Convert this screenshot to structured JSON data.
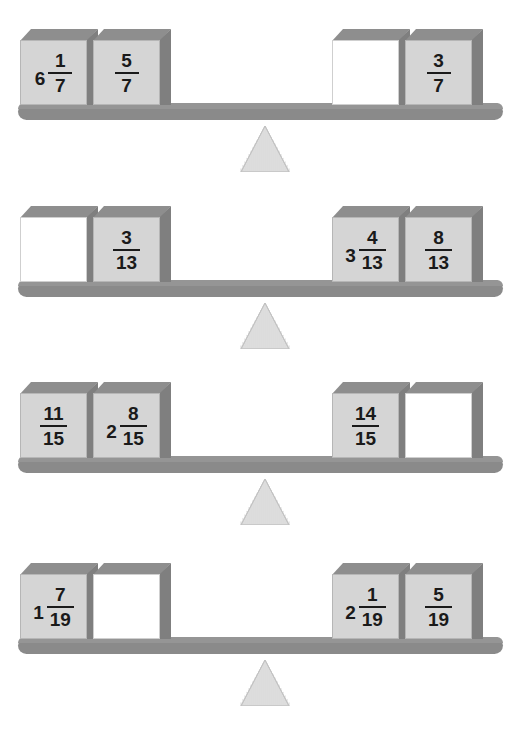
{
  "page": {
    "background_color": "#ffffff",
    "block_color": "#d5d5d5",
    "empty_block_color": "#ffffff",
    "beam_color": "#8a8a8a",
    "fulcrum_color": "#e8e8e8",
    "text_color": "#1a1a1a"
  },
  "balances": [
    {
      "id": "balance-1",
      "denominator": "7",
      "left": [
        {
          "whole": "6",
          "num": "1",
          "den": "7",
          "empty": false
        },
        {
          "whole": "",
          "num": "5",
          "den": "7",
          "empty": false
        }
      ],
      "right": [
        {
          "whole": "",
          "num": "",
          "den": "",
          "empty": true
        },
        {
          "whole": "",
          "num": "3",
          "den": "7",
          "empty": false
        }
      ]
    },
    {
      "id": "balance-2",
      "denominator": "13",
      "left": [
        {
          "whole": "",
          "num": "",
          "den": "",
          "empty": true
        },
        {
          "whole": "",
          "num": "3",
          "den": "13",
          "empty": false
        }
      ],
      "right": [
        {
          "whole": "3",
          "num": "4",
          "den": "13",
          "empty": false
        },
        {
          "whole": "",
          "num": "8",
          "den": "13",
          "empty": false
        }
      ]
    },
    {
      "id": "balance-3",
      "denominator": "15",
      "left": [
        {
          "whole": "",
          "num": "11",
          "den": "15",
          "empty": false
        },
        {
          "whole": "2",
          "num": "8",
          "den": "15",
          "empty": false
        }
      ],
      "right": [
        {
          "whole": "",
          "num": "14",
          "den": "15",
          "empty": false
        },
        {
          "whole": "",
          "num": "",
          "den": "",
          "empty": true
        }
      ]
    },
    {
      "id": "balance-4",
      "denominator": "19",
      "left": [
        {
          "whole": "1",
          "num": "7",
          "den": "19",
          "empty": false
        },
        {
          "whole": "",
          "num": "",
          "den": "",
          "empty": true
        }
      ],
      "right": [
        {
          "whole": "2",
          "num": "1",
          "den": "19",
          "empty": false
        },
        {
          "whole": "",
          "num": "5",
          "den": "19",
          "empty": false
        }
      ]
    }
  ]
}
